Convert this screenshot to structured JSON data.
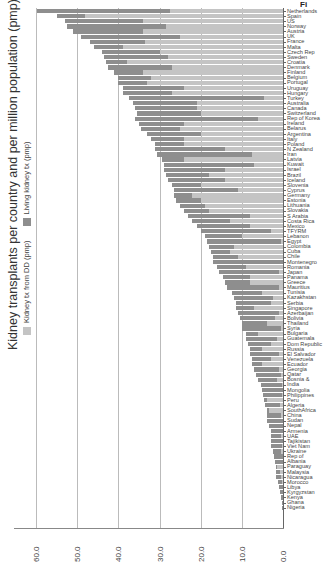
{
  "figure": {
    "caption_fragment": "Fi",
    "title": "Kidney transplants per country and per million population (pmp)"
  },
  "legend": {
    "items": [
      {
        "label": "Kidney tx from DD (pmp)",
        "color": "#c4c4c4"
      },
      {
        "label": "Living kidney tx (pmp)",
        "color": "#8e8e8e"
      }
    ]
  },
  "axis": {
    "ticks": [
      "60.0",
      "50.0",
      "40.0",
      "30.0",
      "20.0",
      "10.0",
      "0.0"
    ]
  },
  "chart_data": {
    "type": "bar",
    "orientation": "stacked bar, figure rotated 90 degrees",
    "title": "Kidney transplants per country and per million population (pmp)",
    "xlabel": "",
    "ylabel": "Transplants pmp",
    "ylim": [
      0,
      60
    ],
    "grid": true,
    "legend_position": "top (rotated, left side of image)",
    "categories": [
      "Netherlands",
      "Spain",
      "US",
      "Norway",
      "Austria",
      "UK",
      "France",
      "Malta",
      "Czech Rep",
      "Sweden",
      "Croatia",
      "Denmark",
      "Finland",
      "Belgium",
      "Portugal",
      "Uruguay",
      "Hungary",
      "Turkey",
      "Australia",
      "Canada",
      "Switzerland",
      "Rep of Korea",
      "Ireland",
      "Belarus",
      "Argentina",
      "Italy",
      "Poland",
      "N Zealand",
      "Iran",
      "Latvia",
      "Kuwait",
      "Israel",
      "Brazil",
      "Iceland",
      "Slovenia",
      "Cyprus",
      "Germany",
      "Estonia",
      "Lithuania",
      "Slovakia",
      "S Arabia",
      "Costa Rica",
      "Mexico",
      "TFYRM",
      "Lebanon",
      "Egypt",
      "Colombia",
      "Cuba",
      "Chile",
      "Montenegro",
      "Romania",
      "Japan",
      "Panama",
      "Greece",
      "Mauritius",
      "Tunisia",
      "Kazakhstan",
      "Serbia",
      "Singapore",
      "Azerbaijan",
      "Bolivia",
      "Thailand",
      "Syria",
      "Bulgaria",
      "Guatemala",
      "Dom Republic",
      "Russia",
      "El Salvador",
      "Venezuela",
      "Ecuador",
      "Georgia",
      "Qatar",
      "Bosnia &",
      "India",
      "Mongolia",
      "Philippines",
      "Peru",
      "Algeria",
      "SouthAfrica",
      "China",
      "Sudan",
      "Nepal",
      "Armenia",
      "UAE",
      "Tajikistan",
      "Viet Nam",
      "Ukraine",
      "Rep of",
      "Albania",
      "Paraguay",
      "Malaysia",
      "Nicaragua",
      "Morocco",
      "Libya",
      "Kyrgyzstan",
      "Kenya",
      "Ghana",
      "Nigeria"
    ],
    "series": [
      {
        "name": "Kidney tx from DD (pmp)",
        "values": [
          27.4,
          48.0,
          34.0,
          28.5,
          34.0,
          25.0,
          33.5,
          39.0,
          30.0,
          28.0,
          38.0,
          27.0,
          34.0,
          32.0,
          33.0,
          24.0,
          27.0,
          4.5,
          21.0,
          21.0,
          20.0,
          6.0,
          24.0,
          25.0,
          20.0,
          24.0,
          24.0,
          14.0,
          7.5,
          24.0,
          7.0,
          14.0,
          18.0,
          14.0,
          20.0,
          11.0,
          22.0,
          20.0,
          19.0,
          18.0,
          8.0,
          13.0,
          8.0,
          3.0,
          10.0,
          0.5,
          12.0,
          13.0,
          11.0,
          0.0,
          9.0,
          1.0,
          8.0,
          8.0,
          1.0,
          5.0,
          2.5,
          3.0,
          7.0,
          1.0,
          2.0,
          4.0,
          0.5,
          6.0,
          1.5,
          3.0,
          5.0,
          1.0,
          3.0,
          5.0,
          1.0,
          0.5,
          1.5,
          0.3,
          0.0,
          0.3,
          4.0,
          0.8,
          3.5,
          0.5,
          0.0,
          0.0,
          0.0,
          0.5,
          0.0,
          0.2,
          0.6,
          0.0,
          0.0,
          1.5,
          0.8,
          0.4,
          0.2,
          0.0,
          0.0,
          0.0,
          0.0,
          0.0
        ]
      },
      {
        "name": "Living kidney tx (pmp)",
        "values": [
          32.3,
          7.0,
          19.0,
          24.0,
          17.0,
          24.0,
          13.5,
          7.0,
          14.0,
          15.5,
          5.0,
          15.5,
          7.0,
          8.0,
          7.0,
          15.0,
          12.0,
          33.0,
          15.5,
          15.0,
          15.5,
          30.0,
          11.0,
          9.5,
          13.0,
          8.0,
          7.0,
          17.0,
          23.0,
          5.5,
          22.0,
          15.0,
          10.5,
          14.0,
          7.0,
          15.5,
          4.5,
          6.0,
          6.0,
          6.0,
          15.0,
          9.0,
          13.0,
          17.0,
          9.0,
          18.0,
          6.0,
          4.5,
          6.0,
          17.0,
          7.0,
          14.5,
          6.5,
          6.0,
          12.5,
          7.5,
          9.5,
          8.5,
          4.5,
          10.0,
          8.5,
          6.0,
          9.5,
          3.0,
          7.5,
          5.5,
          3.0,
          7.0,
          4.5,
          2.5,
          6.0,
          6.0,
          4.5,
          5.0,
          5.0,
          4.5,
          0.5,
          3.5,
          0.5,
          3.5,
          4.0,
          3.5,
          3.0,
          2.5,
          3.0,
          2.6,
          1.8,
          2.2,
          2.0,
          0.3,
          1.0,
          1.2,
          1.0,
          1.0,
          0.8,
          0.5,
          0.3,
          0.2
        ]
      }
    ]
  }
}
